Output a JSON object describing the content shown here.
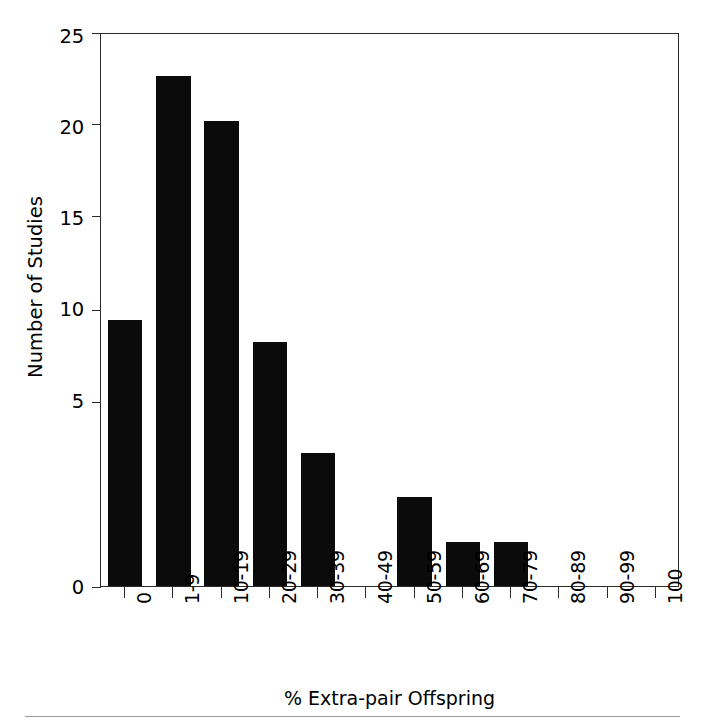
{
  "chart_data": {
    "type": "bar",
    "title": "",
    "xlabel": "% Extra-pair Offspring",
    "ylabel": "Number of Studies",
    "categories": [
      "0",
      "1-9",
      "10-19",
      "20-29",
      "30-39",
      "40-49",
      "50-59",
      "60-69",
      "70-79",
      "80-89",
      "90-99",
      "100"
    ],
    "values": [
      12,
      23,
      21,
      11,
      6,
      0,
      4,
      2,
      2,
      0,
      0,
      0
    ],
    "ylim": [
      0,
      25
    ],
    "yticks": [
      "0",
      "5",
      "10",
      "15",
      "20",
      "25"
    ],
    "ytick_values": [
      0,
      5,
      10,
      15,
      20,
      25
    ],
    "grid": false,
    "legend": false,
    "bar_color": "#0b0b0b",
    "axis_color": "#2b2b2b",
    "background": "#ffffff"
  },
  "figure": {
    "axis_title_y": "Number of Studies",
    "axis_title_x": "% Extra-pair Offspring",
    "rule_color": "#9a9a9a"
  }
}
